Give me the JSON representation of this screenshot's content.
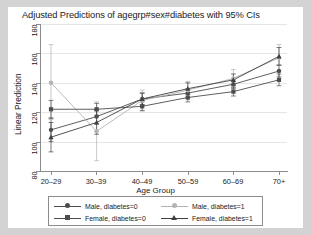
{
  "chart_data": {
    "type": "line",
    "title": "Adjusted Predictions of agegrp#sex#diabetes with 95% CIs",
    "xlabel": "Age Group",
    "ylabel": "Linear Prediction",
    "categories": [
      "20–29",
      "30–39",
      "40–49",
      "50–59",
      "60–69",
      "70+"
    ],
    "ylim": [
      80,
      180
    ],
    "yticks": [
      80,
      100,
      120,
      140,
      160,
      180
    ],
    "grid": true,
    "legend_position": "below-plot",
    "error_bars": "95% CI",
    "series": [
      {
        "name": "Male, diabetes=0",
        "marker": "circle",
        "color": "#4d4d4d",
        "values": [
          108,
          117,
          129,
          133,
          139,
          148
        ],
        "ci_low": [
          100,
          112,
          125,
          130,
          136,
          144
        ],
        "ci_high": [
          116,
          122,
          133,
          136,
          142,
          152
        ]
      },
      {
        "name": "Male, diabetes=1",
        "marker": "circle",
        "color": "#b3b3b3",
        "values": [
          140,
          107,
          128,
          135,
          143,
          157
        ],
        "ci_low": [
          115,
          87,
          121,
          129,
          137,
          148
        ],
        "ci_high": [
          166,
          127,
          135,
          141,
          149,
          166
        ]
      },
      {
        "name": "Female, diabetes=0",
        "marker": "square",
        "color": "#4d4d4d",
        "values": [
          122,
          122,
          124,
          130,
          134,
          142
        ],
        "ci_low": [
          116,
          118,
          121,
          127,
          131,
          138
        ],
        "ci_high": [
          128,
          126,
          127,
          133,
          137,
          146
        ]
      },
      {
        "name": "Female, diabetes=1",
        "marker": "triangle",
        "color": "#404040",
        "values": [
          103,
          113,
          129,
          136,
          142,
          158
        ],
        "ci_low": [
          93,
          105,
          125,
          132,
          138,
          152
        ],
        "ci_high": [
          113,
          121,
          133,
          140,
          146,
          164
        ]
      }
    ]
  },
  "legend": {
    "entries": [
      {
        "label": "Male, diabetes=0"
      },
      {
        "label": "Male, diabetes=1"
      },
      {
        "label": "Female, diabetes=0"
      },
      {
        "label": "Female, diabetes=1"
      }
    ]
  }
}
